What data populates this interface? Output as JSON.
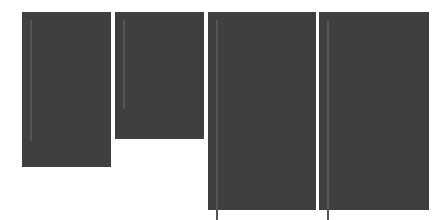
{
  "figure": {
    "colors": {
      "frame": "#3f3f3f",
      "gridline": "#555555",
      "on": "#000000",
      "off": "#ffffff"
    },
    "glyphs": [
      {
        "name": "glyph-r-8x15",
        "frame": {
          "x": 22,
          "y": 12,
          "w": 89,
          "h": 155
        },
        "grid": {
          "x": 30,
          "y": 20,
          "cell": 9
        },
        "cols": 8,
        "rows": 15,
        "on": [
          [
            6,
            1
          ],
          [
            6,
            2
          ],
          [
            6,
            5
          ],
          [
            6,
            6
          ],
          [
            7,
            1
          ],
          [
            7,
            2
          ],
          [
            7,
            4
          ],
          [
            7,
            5
          ],
          [
            7,
            6
          ],
          [
            8,
            1
          ],
          [
            8,
            2
          ],
          [
            8,
            3
          ],
          [
            9,
            1
          ],
          [
            9,
            2
          ],
          [
            10,
            1
          ],
          [
            10,
            2
          ],
          [
            11,
            1
          ],
          [
            11,
            2
          ],
          [
            12,
            1
          ],
          [
            12,
            2
          ]
        ]
      },
      {
        "name": "glyph-r-8x11",
        "frame": {
          "x": 115,
          "y": 12,
          "w": 89,
          "h": 127
        },
        "grid": {
          "x": 123,
          "y": 20,
          "cell": 9
        },
        "cols": 8,
        "rows": 11,
        "on": [
          [
            4,
            0
          ],
          [
            4,
            1
          ],
          [
            4,
            2
          ],
          [
            4,
            4
          ],
          [
            4,
            5
          ],
          [
            5,
            1
          ],
          [
            5,
            2
          ],
          [
            5,
            4
          ],
          [
            5,
            5
          ],
          [
            5,
            6
          ],
          [
            6,
            1
          ],
          [
            6,
            2
          ],
          [
            6,
            3
          ],
          [
            6,
            5
          ],
          [
            6,
            6
          ],
          [
            7,
            1
          ],
          [
            7,
            2
          ],
          [
            8,
            1
          ],
          [
            8,
            2
          ],
          [
            9,
            0
          ],
          [
            9,
            1
          ],
          [
            9,
            2
          ],
          [
            9,
            3
          ]
        ]
      },
      {
        "name": "glyph-r-10x20",
        "frame": {
          "x": 208,
          "y": 12,
          "w": 108,
          "h": 198
        },
        "grid": {
          "x": 216,
          "y": 20,
          "cell": 9
        },
        "cols": 10,
        "rows": 20,
        "on": [
          [
            7,
            1
          ],
          [
            7,
            2
          ],
          [
            7,
            4
          ],
          [
            7,
            5
          ],
          [
            7,
            6
          ],
          [
            7,
            7
          ],
          [
            7,
            8
          ],
          [
            8,
            1
          ],
          [
            8,
            2
          ],
          [
            8,
            3
          ],
          [
            8,
            4
          ],
          [
            8,
            5
          ],
          [
            8,
            6
          ],
          [
            8,
            7
          ],
          [
            8,
            8
          ],
          [
            9,
            1
          ],
          [
            9,
            2
          ],
          [
            9,
            3
          ],
          [
            9,
            4
          ],
          [
            10,
            1
          ],
          [
            10,
            2
          ],
          [
            10,
            3
          ],
          [
            11,
            1
          ],
          [
            11,
            2
          ],
          [
            12,
            1
          ],
          [
            12,
            2
          ],
          [
            13,
            1
          ],
          [
            13,
            2
          ],
          [
            14,
            1
          ],
          [
            14,
            2
          ],
          [
            15,
            1
          ],
          [
            15,
            2
          ]
        ]
      },
      {
        "name": "glyph-r-10x20-b",
        "frame": {
          "x": 319,
          "y": 12,
          "w": 110,
          "h": 198
        },
        "grid": {
          "x": 327,
          "y": 20,
          "cell": 9
        },
        "cols": 10,
        "rows": 20,
        "on": [
          [
            7,
            1
          ],
          [
            7,
            2
          ],
          [
            7,
            4
          ],
          [
            7,
            5
          ],
          [
            7,
            6
          ],
          [
            7,
            7
          ],
          [
            7,
            8
          ],
          [
            8,
            1
          ],
          [
            8,
            2
          ],
          [
            8,
            3
          ],
          [
            8,
            4
          ],
          [
            8,
            5
          ],
          [
            8,
            6
          ],
          [
            8,
            7
          ],
          [
            8,
            8
          ],
          [
            9,
            1
          ],
          [
            9,
            2
          ],
          [
            9,
            3
          ],
          [
            9,
            4
          ],
          [
            10,
            1
          ],
          [
            10,
            2
          ],
          [
            10,
            3
          ],
          [
            11,
            1
          ],
          [
            11,
            2
          ],
          [
            12,
            1
          ],
          [
            12,
            2
          ],
          [
            13,
            1
          ],
          [
            13,
            2
          ],
          [
            14,
            1
          ],
          [
            14,
            2
          ],
          [
            15,
            1
          ],
          [
            15,
            2
          ]
        ]
      }
    ]
  }
}
